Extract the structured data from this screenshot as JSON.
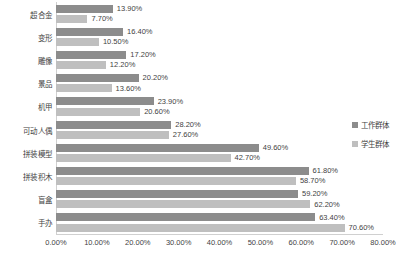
{
  "chart_data": {
    "type": "bar",
    "orientation": "horizontal",
    "title": "",
    "subtitle": "",
    "xlabel": "",
    "ylabel": "",
    "xlim": [
      0,
      80
    ],
    "xticks": [
      "0.00%",
      "10.00%",
      "20.00%",
      "30.00%",
      "40.00%",
      "50.00%",
      "60.00%",
      "70.00%",
      "80.00%"
    ],
    "xtick_values": [
      0,
      10,
      20,
      30,
      40,
      50,
      60,
      70,
      80
    ],
    "grid": false,
    "legend_position": "right",
    "value_label_suffix": "%",
    "categories": [
      "超合金",
      "变形",
      "雕像",
      "景品",
      "机甲",
      "可动人偶",
      "拼装模型",
      "拼装积木",
      "盲盒",
      "手办"
    ],
    "series": [
      {
        "name": "工作群体",
        "color": "#8c8c8c",
        "values": [
          13.9,
          16.4,
          17.2,
          20.2,
          23.9,
          28.2,
          49.6,
          61.8,
          59.2,
          63.4
        ],
        "labels": [
          "13.90%",
          "16.40%",
          "17.20%",
          "20.20%",
          "23.90%",
          "28.20%",
          "49.60%",
          "61.80%",
          "59.20%",
          "63.40%"
        ]
      },
      {
        "name": "学生群体",
        "color": "#bfbfbf",
        "values": [
          7.7,
          10.5,
          12.2,
          13.6,
          20.6,
          27.6,
          42.7,
          58.7,
          62.2,
          70.6
        ],
        "labels": [
          "7.70%",
          "10.50%",
          "12.20%",
          "13.60%",
          "20.60%",
          "27.60%",
          "42.70%",
          "58.70%",
          "62.20%",
          "70.60%"
        ]
      }
    ]
  }
}
